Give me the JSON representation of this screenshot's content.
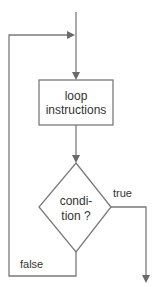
{
  "diagram": {
    "type": "flowchart",
    "title_cut_off": "",
    "nodes": {
      "process": {
        "line1": "loop",
        "line2": "instructions"
      },
      "decision": {
        "line1": "condi-",
        "line2": "tion ?"
      }
    },
    "edges": {
      "true_label": "true",
      "false_label": "false"
    },
    "colors": {
      "stroke": "#7a7a7a",
      "text": "#333333",
      "background": "#ffffff"
    }
  }
}
